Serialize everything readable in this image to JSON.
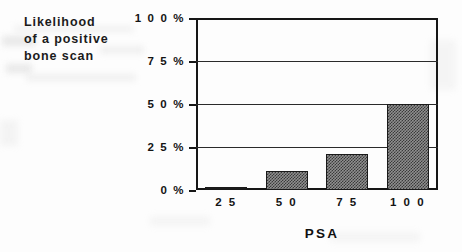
{
  "caption": {
    "lines": [
      "Likelihood",
      "of a positive",
      "bone scan"
    ]
  },
  "chart_data": {
    "type": "bar",
    "title": "Likelihood of a positive bone scan",
    "xlabel": "PSA",
    "ylabel": "",
    "categories": [
      "25",
      "50",
      "75",
      "100"
    ],
    "values": [
      1,
      11,
      21,
      50
    ],
    "value_labels": [
      "1%",
      "11%",
      "21%",
      "50%"
    ],
    "ylim": [
      0,
      100
    ],
    "ytick_values": [
      0,
      25,
      50,
      75,
      100
    ],
    "ytick_labels": [
      "0 %",
      "2 5 %",
      "5 0 %",
      "7 5 %",
      "1 0 0 %"
    ],
    "xtick_labels": [
      "2 5",
      "5 0",
      "7 5",
      "1 0 0"
    ],
    "grid": true,
    "legend": false,
    "bar_fill": "#8f8f8f",
    "bar_pattern": "checker-dither",
    "bar_edge_color": "#1a1a1a",
    "axis_color": "#161616",
    "background": "#fdfdfd"
  },
  "colors": {
    "ink": "#141414",
    "bar_fill": "#8f8f8f",
    "bar_edge": "#1a1a1a",
    "grid": "#2a2a2a",
    "smudge": "#e2e2e2"
  }
}
